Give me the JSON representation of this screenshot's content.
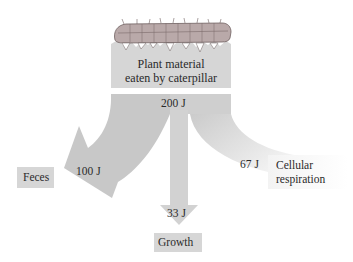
{
  "diagram": {
    "source": {
      "label_line1": "Plant material",
      "label_line2": "eaten by caterpillar",
      "energy": "200 J"
    },
    "outputs": [
      {
        "name": "Feces",
        "energy": "100 J",
        "direction": "left"
      },
      {
        "name": "Growth",
        "energy": "33 J",
        "direction": "down"
      },
      {
        "name": "Cellular respiration",
        "name_line1": "Cellular",
        "name_line2": "respiration",
        "energy": "67 J",
        "direction": "right"
      }
    ],
    "icons": [
      "caterpillar-illustration"
    ],
    "colors": {
      "flow_gray": "#c8c8c8",
      "box_gray": "#d6d6d6",
      "text": "#2a2a2a",
      "background": "#ffffff"
    }
  }
}
